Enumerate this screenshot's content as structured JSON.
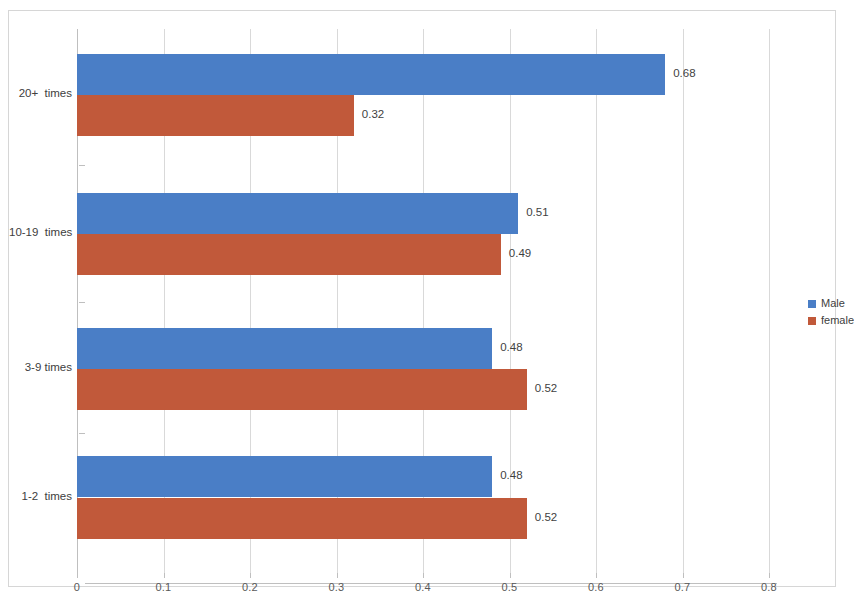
{
  "chart_data": {
    "type": "bar",
    "orientation": "horizontal",
    "title": "",
    "xlabel": "",
    "ylabel": "",
    "categories": [
      "20+  times",
      "10-19  times",
      "3-9 times",
      "1-2  times"
    ],
    "series": [
      {
        "name": "Male",
        "color": "#4a7ec6",
        "values": [
          0.68,
          0.51,
          0.48,
          0.48
        ]
      },
      {
        "name": "female",
        "color": "#c1593a",
        "values": [
          0.32,
          0.49,
          0.52,
          0.52
        ]
      }
    ],
    "value_labels": [
      [
        "0.68",
        "0.51",
        "0.48",
        "0.48"
      ],
      [
        "0.32",
        "0.49",
        "0.52",
        "0.52"
      ]
    ],
    "xlim": [
      0,
      0.8
    ],
    "xticks": [
      0,
      0.1,
      0.2,
      0.3,
      0.4,
      0.5,
      0.6,
      0.7,
      0.8
    ],
    "xtick_labels": [
      "0",
      "0.1",
      "0.2",
      "0.3",
      "0.4",
      "0.5",
      "0.6",
      "0.7",
      "0.8"
    ],
    "grid": {
      "vertical": true,
      "horizontal": false
    },
    "legend": {
      "position": "right",
      "entries": [
        "Male",
        "female"
      ]
    }
  },
  "colors": {
    "male": "#4a7ec6",
    "female": "#c1593a",
    "gridline": "#d9d9d9",
    "axis": "#bfbfbf",
    "text": "#404040",
    "frame": "#d6d6d6"
  }
}
